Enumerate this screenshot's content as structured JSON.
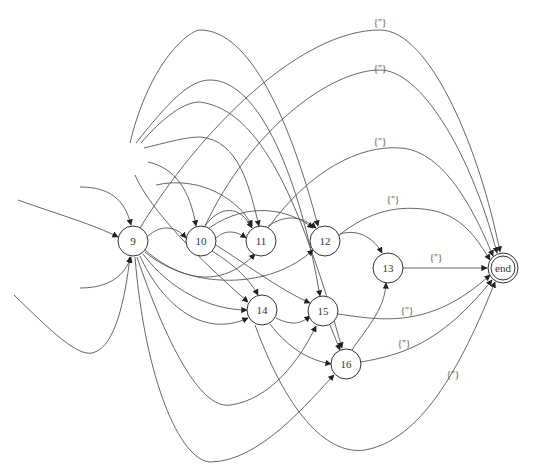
{
  "graph": {
    "type": "directed-graph",
    "nodes": [
      {
        "id": "9",
        "label": "9",
        "x": 133,
        "y": 241,
        "shape": "circle"
      },
      {
        "id": "10",
        "label": "10",
        "x": 201,
        "y": 241,
        "shape": "circle"
      },
      {
        "id": "11",
        "label": "11",
        "x": 261,
        "y": 241,
        "shape": "circle"
      },
      {
        "id": "12",
        "label": "12",
        "x": 325,
        "y": 241,
        "shape": "circle"
      },
      {
        "id": "13",
        "label": "13",
        "x": 388,
        "y": 268,
        "shape": "circle"
      },
      {
        "id": "14",
        "label": "14",
        "x": 262,
        "y": 310,
        "shape": "circle"
      },
      {
        "id": "15",
        "label": "15",
        "x": 323,
        "y": 311,
        "shape": "circle"
      },
      {
        "id": "16",
        "label": "16",
        "x": 346,
        "y": 364,
        "shape": "circle"
      },
      {
        "id": "end",
        "label": "end",
        "x": 503,
        "y": 268,
        "shape": "doublecircle"
      }
    ],
    "edge_labels": [
      {
        "text": "{''}",
        "x": 380,
        "y": 26
      },
      {
        "text": "{''}",
        "x": 380,
        "y": 72
      },
      {
        "text": "{''}",
        "x": 380,
        "y": 145
      },
      {
        "text": "{''}",
        "x": 393,
        "y": 203
      },
      {
        "text": "{''}",
        "x": 436,
        "y": 261
      },
      {
        "text": "{''}",
        "x": 407,
        "y": 314
      },
      {
        "text": "{''}",
        "x": 404,
        "y": 347
      },
      {
        "text": "{''}",
        "x": 453,
        "y": 378
      }
    ],
    "colors": {
      "stroke": "#555555",
      "node_stroke": "#333333",
      "background": "#ffffff"
    }
  }
}
